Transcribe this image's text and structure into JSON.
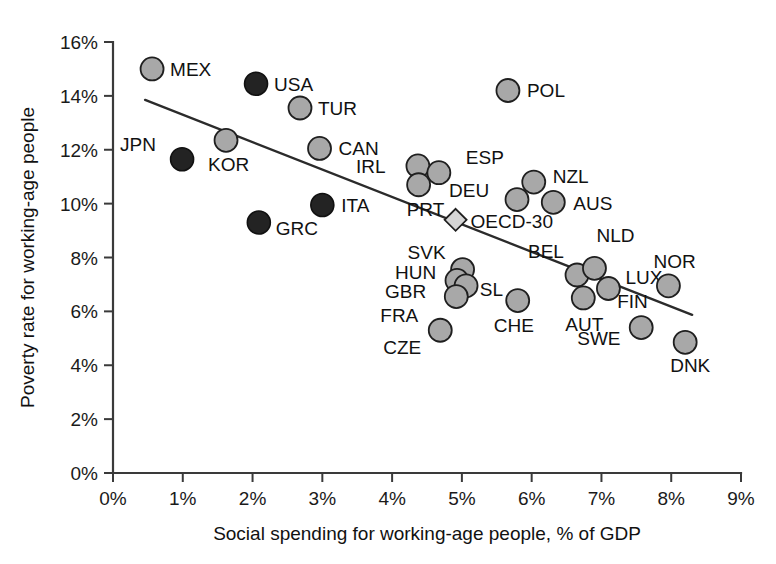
{
  "chart_data": {
    "type": "scatter",
    "title": "",
    "xlabel": "Social spending for working-age people, % of GDP",
    "ylabel": "Poverty rate for working-age people",
    "xlim": [
      0,
      9
    ],
    "ylim": [
      0,
      16
    ],
    "xticks": [
      "0%",
      "1%",
      "2%",
      "3%",
      "4%",
      "5%",
      "6%",
      "7%",
      "8%",
      "9%"
    ],
    "yticks": [
      "0%",
      "2%",
      "4%",
      "6%",
      "8%",
      "10%",
      "12%",
      "14%",
      "16%"
    ],
    "grid": false,
    "legend": "none",
    "marker_styles": {
      "gray": "#a8a8a8",
      "dark": "#232323",
      "diamond": "#d6d6d6"
    },
    "trendline": {
      "label": "linear fit",
      "x_start": 0.46,
      "y_start": 13.85,
      "x_end": 8.3,
      "y_end": 5.87
    },
    "points": [
      {
        "code": "MEX",
        "x": 0.56,
        "y": 15.0,
        "style": "gray",
        "label_dx": 18,
        "label_dy": 7
      },
      {
        "code": "USA",
        "x": 2.05,
        "y": 14.45,
        "style": "dark",
        "label_dx": 18,
        "label_dy": 7
      },
      {
        "code": "TUR",
        "x": 2.68,
        "y": 13.55,
        "style": "gray",
        "label_dx": 18,
        "label_dy": 7
      },
      {
        "code": "POL",
        "x": 5.66,
        "y": 14.2,
        "style": "gray",
        "label_dx": 19,
        "label_dy": 7
      },
      {
        "code": "JPN",
        "x": 0.99,
        "y": 11.65,
        "style": "dark",
        "label_dx": -62,
        "label_dy": -8
      },
      {
        "code": "KOR",
        "x": 1.62,
        "y": 12.35,
        "style": "gray",
        "label_dx": -18,
        "label_dy": 31
      },
      {
        "code": "CAN",
        "x": 2.96,
        "y": 12.05,
        "style": "gray",
        "label_dx": 19,
        "label_dy": 7
      },
      {
        "code": "IRL",
        "x": 4.37,
        "y": 11.4,
        "style": "gray",
        "label_dx": -62,
        "label_dy": 7
      },
      {
        "code": "ESP",
        "x": 4.67,
        "y": 11.15,
        "style": "gray",
        "label_dx": 27,
        "label_dy": -9
      },
      {
        "code": "PRT",
        "x": 4.38,
        "y": 10.7,
        "style": "gray",
        "label_dx": -12,
        "label_dy": 31
      },
      {
        "code": "DEU",
        "x": 5.79,
        "y": 10.15,
        "style": "gray",
        "label_dx": -68,
        "label_dy": -3
      },
      {
        "code": "NZL",
        "x": 6.03,
        "y": 10.8,
        "style": "gray",
        "label_dx": 19,
        "label_dy": 1
      },
      {
        "code": "AUS",
        "x": 6.31,
        "y": 10.05,
        "style": "gray",
        "label_dx": 20,
        "label_dy": 8
      },
      {
        "code": "ITA",
        "x": 3.0,
        "y": 9.95,
        "style": "dark",
        "label_dx": 19,
        "label_dy": 7
      },
      {
        "code": "GRC",
        "x": 2.09,
        "y": 9.3,
        "style": "dark",
        "label_dx": 17,
        "label_dy": 13
      },
      {
        "code": "OECD-30",
        "x": 4.91,
        "y": 9.4,
        "style": "diamond",
        "label_dx": 15,
        "label_dy": 8
      },
      {
        "code": "SVK",
        "x": 5.01,
        "y": 7.55,
        "style": "gray",
        "label_dx": -55,
        "label_dy": -11
      },
      {
        "code": "HUN",
        "x": 4.93,
        "y": 7.15,
        "style": "gray",
        "label_dx": -62,
        "label_dy": -1
      },
      {
        "code": "GBR",
        "x": 5.06,
        "y": 6.95,
        "style": "gray",
        "label_dx": -81,
        "label_dy": 12
      },
      {
        "code": "FRA",
        "x": 4.92,
        "y": 6.55,
        "style": "gray",
        "label_dx": -76,
        "label_dy": 25
      },
      {
        "code": "SL",
        "x": 5.8,
        "y": 6.4,
        "style": "gray",
        "label_dx": -38,
        "label_dy": -5
      },
      {
        "code": "CHE",
        "x": 5.8,
        "y": 6.4,
        "style": "gray",
        "label_dx": -24,
        "label_dy": 31,
        "no_marker": true
      },
      {
        "code": "CZE",
        "x": 4.69,
        "y": 5.3,
        "style": "gray",
        "label_dx": -57,
        "label_dy": 24
      },
      {
        "code": "BEL",
        "x": 6.65,
        "y": 7.35,
        "style": "gray",
        "label_dx": -49,
        "label_dy": -17
      },
      {
        "code": "NLD",
        "x": 6.9,
        "y": 7.6,
        "style": "gray",
        "label_dx": 2,
        "label_dy": -26
      },
      {
        "code": "LUX",
        "x": 7.1,
        "y": 6.85,
        "style": "gray",
        "label_dx": 17,
        "label_dy": -4
      },
      {
        "code": "AUT",
        "x": 6.74,
        "y": 6.5,
        "style": "gray",
        "label_dx": -18,
        "label_dy": 33
      },
      {
        "code": "NOR",
        "x": 7.96,
        "y": 6.95,
        "style": "gray",
        "label_dx": -15,
        "label_dy": -18
      },
      {
        "code": "FIN",
        "x": 7.57,
        "y": 5.4,
        "style": "gray",
        "label_dx": -24,
        "label_dy": -20
      },
      {
        "code": "SWE",
        "x": 7.57,
        "y": 5.4,
        "style": "gray",
        "label_dx": -64,
        "label_dy": 17,
        "no_marker": true
      },
      {
        "code": "DNK",
        "x": 8.2,
        "y": 4.85,
        "style": "gray",
        "label_dx": -15,
        "label_dy": 30
      }
    ]
  }
}
